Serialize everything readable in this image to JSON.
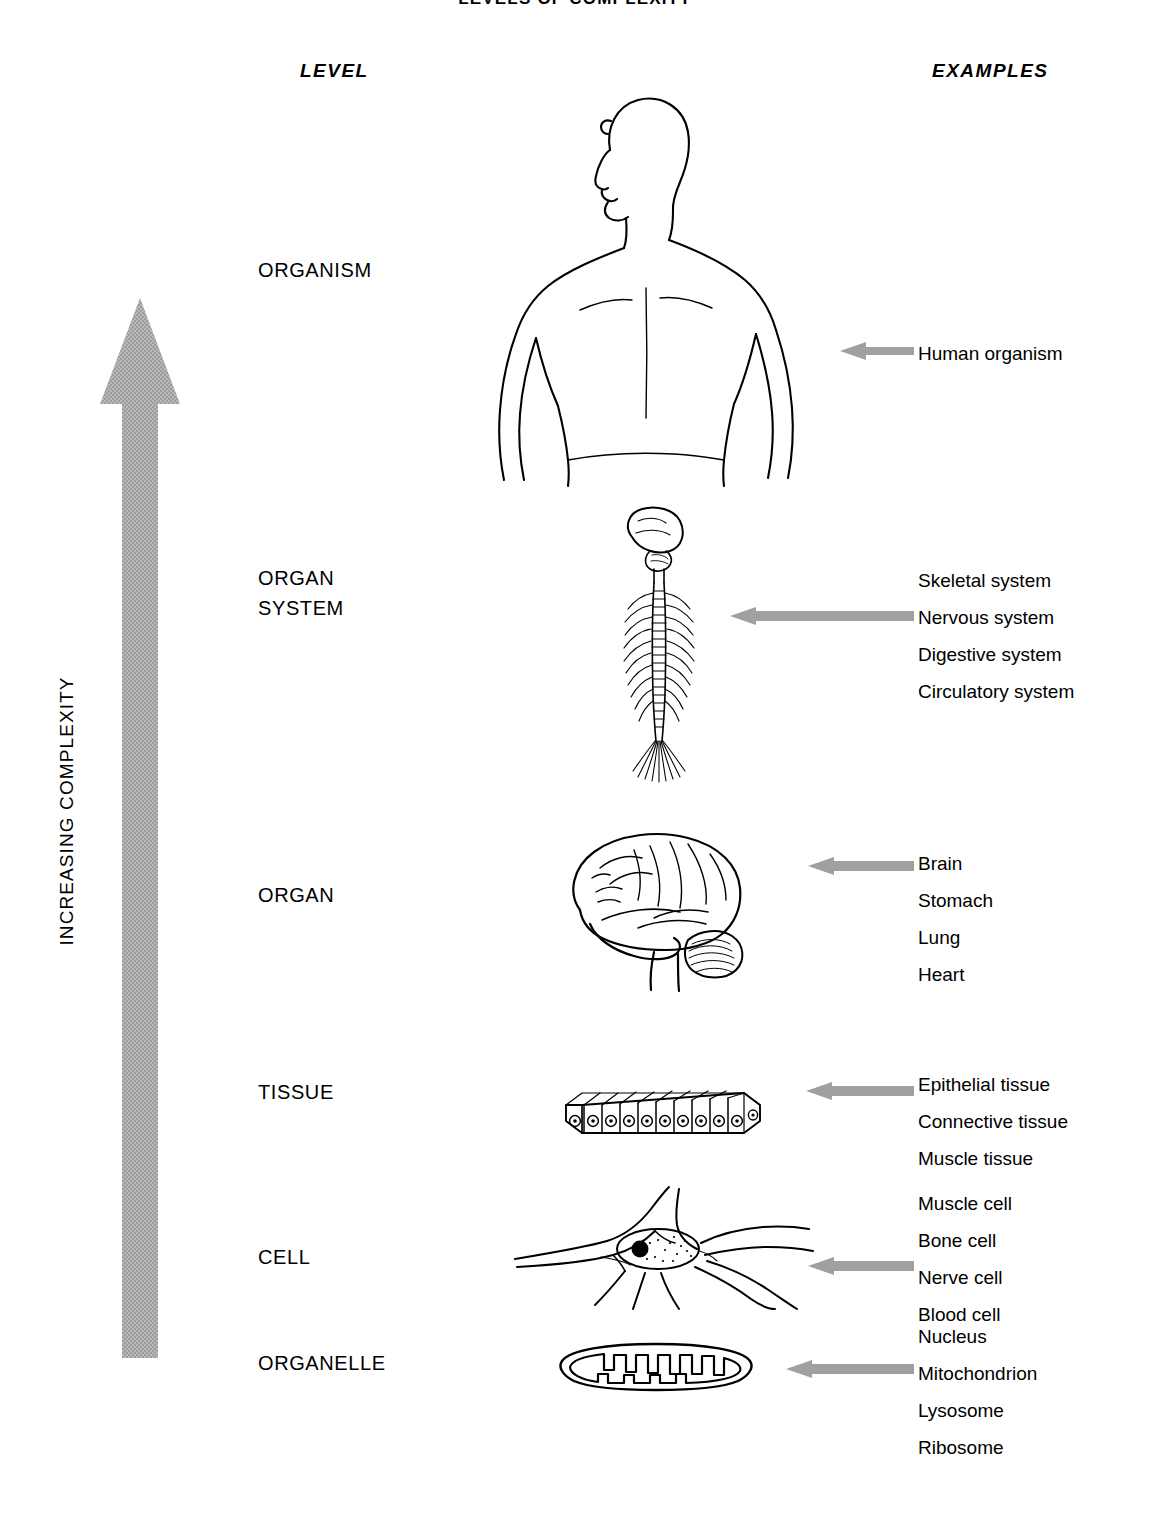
{
  "title": "LEVELS OF COMPLEXITY",
  "axis_label": "INCREASING COMPLEXITY",
  "headers": {
    "level": "LEVEL",
    "examples": "EXAMPLES"
  },
  "colors": {
    "arrow_gray": "#a8a8a8",
    "pointer_gray": "#999999",
    "ink": "#000000",
    "background": "#ffffff"
  },
  "levels": [
    {
      "label": "ORGANISM",
      "figure": "human-body-figure",
      "examples": [
        "Human organism"
      ]
    },
    {
      "label": "ORGAN\nSYSTEM",
      "figure": "nervous-system-figure",
      "examples": [
        "Skeletal system",
        "Nervous system",
        "Digestive system",
        "Circulatory system"
      ]
    },
    {
      "label": "ORGAN",
      "figure": "brain-figure",
      "examples": [
        "Brain",
        "Stomach",
        "Lung",
        "Heart"
      ]
    },
    {
      "label": "TISSUE",
      "figure": "epithelial-tissue-figure",
      "examples": [
        "Epithelial tissue",
        "Connective tissue",
        "Muscle tissue"
      ]
    },
    {
      "label": "CELL",
      "figure": "nerve-cell-figure",
      "examples": [
        "Muscle cell",
        "Bone cell",
        "Nerve cell",
        "Blood cell"
      ]
    },
    {
      "label": "ORGANELLE",
      "figure": "mitochondrion-figure",
      "examples": [
        "Nucleus",
        "Mitochondrion",
        "Lysosome",
        "Ribosome"
      ]
    }
  ]
}
